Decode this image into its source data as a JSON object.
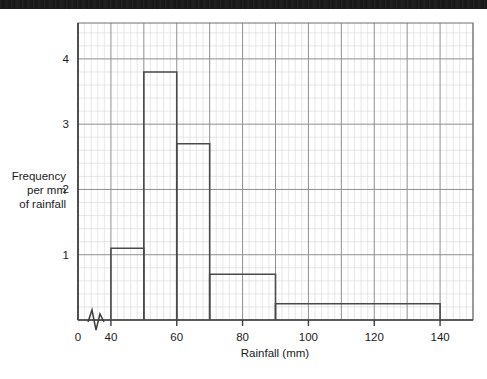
{
  "figure": {
    "background_color": "#ffffff",
    "scan_band_color": "#151515",
    "axis_color": "#3d3d3d",
    "bar_line_color": "#4a4a4a",
    "grid_minor_color": "#dcdcdc",
    "grid_medium_color": "#c9c9c9",
    "grid_major_color": "#8f8f8f"
  },
  "chart_data": {
    "type": "bar",
    "title": "",
    "subtitle": "",
    "xlabel": "Rainfall (mm)",
    "ylabel": "Frequency per mm of rainfall",
    "ylabel_lines": [
      "Frequency",
      "per mm",
      "of rainfall"
    ],
    "xlim": [
      30,
      150
    ],
    "ylim": [
      0,
      4.55
    ],
    "x_axis_break": true,
    "x_break_note": "axis break between 0 and 40",
    "xticks": [
      0,
      40,
      60,
      80,
      100,
      120,
      140
    ],
    "xtick_labels": [
      "0",
      "40",
      "60",
      "80",
      "100",
      "120",
      "140"
    ],
    "yticks": [
      1,
      2,
      3,
      4
    ],
    "ytick_labels": [
      "1",
      "2",
      "3",
      "4"
    ],
    "grid": true,
    "grid_minor_step_x": 2,
    "grid_major_step_x": 10,
    "legend": "none",
    "bin_edges": [
      40,
      50,
      60,
      70,
      90,
      140
    ],
    "categories": [
      "40-50",
      "50-60",
      "60-70",
      "70-90",
      "90-140"
    ],
    "values": [
      1.1,
      3.8,
      2.7,
      0.7,
      0.25
    ],
    "bars": [
      {
        "from": 40,
        "to": 50,
        "width": 10,
        "density": 1.1,
        "frequency": 11
      },
      {
        "from": 50,
        "to": 60,
        "width": 10,
        "density": 3.8,
        "frequency": 38
      },
      {
        "from": 60,
        "to": 70,
        "width": 10,
        "density": 2.7,
        "frequency": 27
      },
      {
        "from": 70,
        "to": 90,
        "width": 20,
        "density": 0.7,
        "frequency": 14
      },
      {
        "from": 90,
        "to": 140,
        "width": 50,
        "density": 0.25,
        "frequency": 12.5
      }
    ]
  }
}
